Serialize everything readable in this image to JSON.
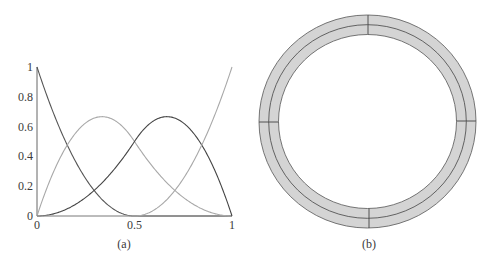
{
  "figure": {
    "panel_a": {
      "caption": "(a)"
    },
    "panel_b": {
      "caption": "(b)"
    }
  },
  "chart_data": [
    {
      "type": "line",
      "title": "",
      "caption": "(a)",
      "xlabel": "",
      "ylabel": "",
      "xlim": [
        0,
        1
      ],
      "ylim": [
        0,
        1
      ],
      "grid": false,
      "legend": null,
      "x_ticks": [
        {
          "value": 0,
          "label": "0"
        },
        {
          "value": 0.5,
          "label": "0.5"
        },
        {
          "value": 1,
          "label": "1"
        }
      ],
      "y_ticks": [
        {
          "value": 0,
          "label": "0"
        },
        {
          "value": 0.2,
          "label": "0.2"
        },
        {
          "value": 0.4,
          "label": "0.4"
        },
        {
          "value": 0.6,
          "label": "0.6"
        },
        {
          "value": 0.8,
          "label": "0.8"
        },
        {
          "value": 1,
          "label": "1"
        }
      ],
      "description": "Quadratic B-spline basis functions, knot vector {0,0,0,0.5,1,1,1}",
      "series": [
        {
          "name": "N0",
          "color": "#555555",
          "x": [
            0,
            0.1,
            0.2,
            0.3,
            0.4,
            0.5,
            0.6,
            0.7,
            0.8,
            0.9,
            1
          ],
          "values": [
            1,
            0.64,
            0.36,
            0.16,
            0.04,
            0,
            0,
            0,
            0,
            0,
            0
          ]
        },
        {
          "name": "N1",
          "color": "#a8a8a8",
          "x": [
            0,
            0.1,
            0.2,
            0.3,
            0.4,
            0.5,
            0.6,
            0.7,
            0.8,
            0.9,
            1
          ],
          "values": [
            0,
            0.34,
            0.56,
            0.66,
            0.64,
            0.5,
            0.32,
            0.18,
            0.08,
            0.02,
            0
          ]
        },
        {
          "name": "N2",
          "color": "#444444",
          "x": [
            0,
            0.1,
            0.2,
            0.3,
            0.4,
            0.5,
            0.6,
            0.7,
            0.8,
            0.9,
            1
          ],
          "values": [
            0,
            0.02,
            0.08,
            0.18,
            0.32,
            0.5,
            0.64,
            0.66,
            0.56,
            0.34,
            0
          ]
        },
        {
          "name": "N3",
          "color": "#a8a8a8",
          "x": [
            0,
            0.1,
            0.2,
            0.3,
            0.4,
            0.5,
            0.6,
            0.7,
            0.8,
            0.9,
            1
          ],
          "values": [
            0,
            0,
            0,
            0,
            0,
            0,
            0.04,
            0.16,
            0.36,
            0.64,
            1
          ]
        }
      ]
    },
    {
      "type": "diagram",
      "caption": "(b)",
      "description": "Circular ring (annulus) shaded gray, split by a middle circle, with four radial divider ticks at top, right, bottom, left",
      "fill_color": "#d4d4d4",
      "stroke_color": "#555555",
      "divider_angles_deg": [
        0,
        90,
        180,
        270
      ]
    }
  ]
}
